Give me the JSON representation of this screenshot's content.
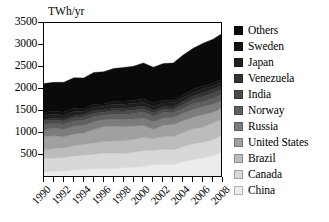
{
  "chart_data": {
    "type": "area",
    "stacked": true,
    "title": "",
    "axis_unit_label": "TWh/yr",
    "xlabel": "",
    "ylabel": "TWh/yr",
    "grid": false,
    "legend_position": "right",
    "xlim": [
      1990,
      2008
    ],
    "ylim": [
      0,
      3500
    ],
    "x": [
      1990,
      1991,
      1992,
      1993,
      1994,
      1995,
      1996,
      1997,
      1998,
      1999,
      2000,
      2001,
      2002,
      2003,
      2004,
      2005,
      2006,
      2007,
      2008
    ],
    "y_ticks": [
      500,
      1000,
      1500,
      2000,
      2500,
      3000,
      3500
    ],
    "y_tick_labels": [
      "500",
      "1000",
      "1500",
      "2000",
      "2500",
      "3000",
      "3500"
    ],
    "x_ticks": [
      1990,
      1991,
      1992,
      1993,
      1994,
      1995,
      1996,
      1997,
      1998,
      1999,
      2000,
      2001,
      2002,
      2003,
      2004,
      2005,
      2006,
      2007,
      2008
    ],
    "x_tick_labels": [
      "1990",
      "",
      "1992",
      "",
      "1994",
      "",
      "1996",
      "",
      "1998",
      "",
      "2000",
      "",
      "2002",
      "",
      "2004",
      "",
      "2006",
      "",
      "2008"
    ],
    "x_major_labels": [
      "1990",
      "1992",
      "1994",
      "1996",
      "1998",
      "2000",
      "2002",
      "2004",
      "2006",
      "2008"
    ],
    "stack_order_bottom_to_top": [
      "China",
      "Canada",
      "Brazil",
      "United States",
      "Russia",
      "Norway",
      "India",
      "Venezuela",
      "Japan",
      "Sweden",
      "Others"
    ],
    "series": [
      {
        "name": "China",
        "color": "#ececec",
        "values": [
          126,
          125,
          130,
          152,
          167,
          187,
          188,
          195,
          208,
          221,
          243,
          277,
          288,
          283,
          353,
          397,
          435,
          485,
          585
        ]
      },
      {
        "name": "Canada",
        "color": "#d8d8d8",
        "values": [
          294,
          307,
          311,
          324,
          329,
          332,
          354,
          350,
          330,
          342,
          355,
          330,
          345,
          336,
          338,
          360,
          352,
          368,
          376
        ]
      },
      {
        "name": "Brazil",
        "color": "#bcbcbc",
        "values": [
          205,
          218,
          224,
          235,
          248,
          254,
          264,
          275,
          287,
          289,
          304,
          268,
          286,
          306,
          321,
          337,
          348,
          374,
          370
        ]
      },
      {
        "name": "United States",
        "color": "#a0a0a0",
        "values": [
          293,
          288,
          248,
          269,
          255,
          305,
          340,
          341,
          318,
          306,
          269,
          209,
          259,
          270,
          264,
          266,
          286,
          247,
          248
        ]
      },
      {
        "name": "Russia",
        "color": "#7c7c7c",
        "values": [
          167,
          168,
          173,
          175,
          177,
          177,
          155,
          158,
          159,
          161,
          165,
          173,
          164,
          158,
          177,
          174,
          175,
          179,
          167
        ]
      },
      {
        "name": "Norway",
        "color": "#606060",
        "values": [
          121,
          110,
          117,
          119,
          112,
          122,
          104,
          111,
          116,
          122,
          142,
          121,
          130,
          106,
          110,
          137,
          121,
          135,
          140
        ]
      },
      {
        "name": "India",
        "color": "#4a4a4a",
        "values": [
          71,
          72,
          69,
          70,
          82,
          72,
          68,
          74,
          82,
          82,
          74,
          74,
          64,
          72,
          85,
          100,
          114,
          123,
          115
        ]
      },
      {
        "name": "Venezuela",
        "color": "#333333",
        "values": [
          36,
          42,
          47,
          50,
          51,
          55,
          56,
          58,
          58,
          62,
          62,
          62,
          60,
          60,
          70,
          74,
          81,
          82,
          86
        ]
      },
      {
        "name": "Japan",
        "color": "#202020",
        "values": [
          88,
          98,
          84,
          95,
          73,
          83,
          80,
          91,
          96,
          85,
          87,
          84,
          85,
          94,
          96,
          78,
          95,
          74,
          83
        ]
      },
      {
        "name": "Sweden",
        "color": "#141414",
        "values": [
          71,
          63,
          74,
          74,
          58,
          67,
          51,
          68,
          74,
          71,
          78,
          78,
          66,
          53,
          60,
          72,
          61,
          66,
          69
        ]
      },
      {
        "name": "Others",
        "color": "#0a0a0a",
        "values": [
          655,
          660,
          675,
          690,
          700,
          722,
          731,
          745,
          760,
          775,
          812,
          820,
          830,
          855,
          900,
          930,
          970,
          1000,
          1035
        ]
      }
    ],
    "legend_entries": [
      {
        "label": "Others",
        "color": "#0a0a0a"
      },
      {
        "label": "Sweden",
        "color": "#141414"
      },
      {
        "label": "Japan",
        "color": "#202020"
      },
      {
        "label": "Venezuela",
        "color": "#333333"
      },
      {
        "label": "India",
        "color": "#4a4a4a"
      },
      {
        "label": "Norway",
        "color": "#606060"
      },
      {
        "label": "Russia",
        "color": "#7c7c7c"
      },
      {
        "label": "United States",
        "color": "#a0a0a0"
      },
      {
        "label": "Brazil",
        "color": "#bcbcbc"
      },
      {
        "label": "Canada",
        "color": "#d8d8d8"
      },
      {
        "label": "China",
        "color": "#ececec"
      }
    ]
  }
}
